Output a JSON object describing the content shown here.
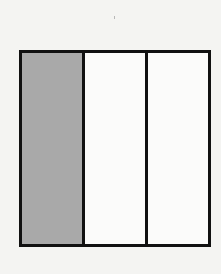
{
  "diagram": {
    "type": "fraction-model",
    "shape": "square",
    "orientation": "vertical-strips",
    "total_parts": 3,
    "shaded_parts": 1,
    "fraction": "1/3",
    "parts": [
      {
        "index": 0,
        "shaded": true
      },
      {
        "index": 1,
        "shaded": false
      },
      {
        "index": 2,
        "shaded": false
      }
    ],
    "colors": {
      "shaded": "#a9a9a9",
      "unshaded": "#fbfbfa",
      "outline": "#111111",
      "background": "#f4f4f2"
    }
  }
}
